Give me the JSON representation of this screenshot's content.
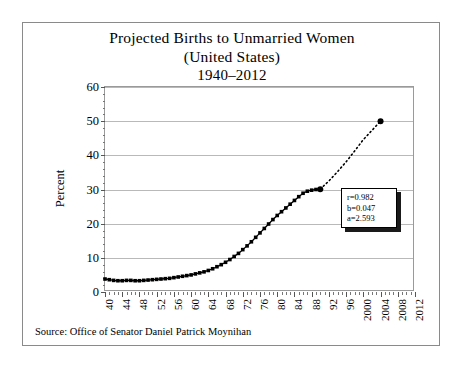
{
  "chart_data": {
    "type": "scatter",
    "title": "Projected Births to Unmarried Women",
    "title_line2": "(United States)",
    "title_line3": "1940–2012",
    "xlabel": "",
    "ylabel": "Percent",
    "ylim": [
      0,
      60
    ],
    "xlim": [
      1940,
      2012
    ],
    "ytick_values": [
      0,
      10,
      20,
      30,
      40,
      50,
      60
    ],
    "ytick_labels": [
      "0",
      "10",
      "20",
      "30",
      "40",
      "50",
      "60"
    ],
    "xtick_values": [
      1940,
      1944,
      1948,
      1952,
      1956,
      1960,
      1964,
      1968,
      1972,
      1976,
      1980,
      1984,
      1988,
      1992,
      1996,
      2000,
      2004,
      2008,
      2012
    ],
    "xtick_labels": [
      "40",
      "44",
      "48",
      "52",
      "56",
      "60",
      "64",
      "68",
      "72",
      "76",
      "80",
      "84",
      "88",
      "92",
      "96",
      "2000",
      "2004",
      "2008",
      "2012"
    ],
    "grid": true,
    "legend": false,
    "annotations": [
      {
        "name": "regression-stats",
        "lines": [
          "r=0.982",
          "b=0.047",
          "a=2.593"
        ]
      }
    ],
    "series": [
      {
        "name": "Observed births to unmarried women",
        "marker": "square",
        "style": "solid-fit-curve",
        "x": [
          1940,
          1941,
          1942,
          1943,
          1944,
          1945,
          1946,
          1947,
          1948,
          1949,
          1950,
          1951,
          1952,
          1953,
          1954,
          1955,
          1956,
          1957,
          1958,
          1959,
          1960,
          1961,
          1962,
          1963,
          1964,
          1965,
          1966,
          1967,
          1968,
          1969,
          1970,
          1971,
          1972,
          1973,
          1974,
          1975,
          1976,
          1977,
          1978,
          1979,
          1980,
          1981,
          1982,
          1983,
          1984,
          1985,
          1986,
          1987,
          1988,
          1989,
          1990
        ],
        "values": [
          3.8,
          3.6,
          3.4,
          3.3,
          3.3,
          3.4,
          3.4,
          3.3,
          3.3,
          3.4,
          3.5,
          3.6,
          3.7,
          3.8,
          3.9,
          4.0,
          4.2,
          4.4,
          4.6,
          4.8,
          5.0,
          5.3,
          5.6,
          5.9,
          6.3,
          6.8,
          7.4,
          8.0,
          8.7,
          9.5,
          10.4,
          11.3,
          12.4,
          13.5,
          14.7,
          16.0,
          17.3,
          18.6,
          19.9,
          21.2,
          22.4,
          23.5,
          24.6,
          25.7,
          26.8,
          27.9,
          28.9,
          29.5,
          29.8,
          30.0,
          30.1
        ]
      },
      {
        "name": "Projection",
        "marker": "dotted-line",
        "style": "dotted",
        "endpoint_marker": "filled-circle",
        "x": [
          1990,
          1992,
          1994,
          1996,
          1998,
          2000,
          2002,
          2004
        ],
        "values": [
          30.1,
          32.5,
          35.2,
          38.1,
          41.3,
          44.6,
          47.3,
          50.0
        ]
      }
    ]
  },
  "source": {
    "text": "Source: Office of Senator Daniel Patrick Moynihan"
  },
  "colors": {
    "frame": "#8a8a8a",
    "grid": "#b9b9b9",
    "axis": "#555555",
    "data": "#000000",
    "background": "#ffffff"
  }
}
